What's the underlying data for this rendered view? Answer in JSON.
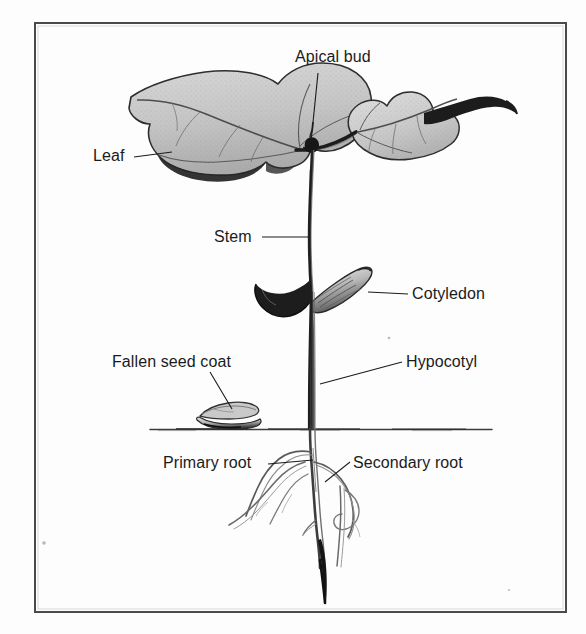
{
  "figure": {
    "background_color": "#fdfdfd",
    "ink_color": "#1b1b1b",
    "frame": {
      "x": 34,
      "y": 22,
      "width": 532,
      "height": 590,
      "border_color": "#4a4a4a",
      "border_width": 2
    },
    "soil_line": {
      "y": 429,
      "x_start": 150,
      "x_end": 492,
      "color": "#3a3a3a"
    }
  },
  "labels": [
    {
      "id": "apical-bud",
      "text": "Apical bud",
      "x": 295,
      "y": 48,
      "align": "left",
      "leader": {
        "x1": 318,
        "y1": 73,
        "x2": 311,
        "y2": 142
      }
    },
    {
      "id": "leaf",
      "text": "Leaf",
      "x": 93,
      "y": 147,
      "align": "left",
      "leader": {
        "x1": 134,
        "y1": 157,
        "x2": 172,
        "y2": 152
      }
    },
    {
      "id": "stem",
      "text": "Stem",
      "x": 214,
      "y": 228,
      "align": "left",
      "leader": {
        "x1": 262,
        "y1": 237,
        "x2": 310,
        "y2": 237
      }
    },
    {
      "id": "cotyledon",
      "text": "Cotyledon",
      "x": 412,
      "y": 285,
      "align": "left",
      "leader": {
        "x1": 408,
        "y1": 294,
        "x2": 368,
        "y2": 292
      }
    },
    {
      "id": "fallen-seed-coat",
      "text": "Fallen seed coat",
      "x": 112,
      "y": 353,
      "align": "left",
      "leader": {
        "x1": 210,
        "y1": 372,
        "x2": 232,
        "y2": 409
      }
    },
    {
      "id": "hypocotyl",
      "text": "Hypocotyl",
      "x": 406,
      "y": 353,
      "align": "left",
      "leader": {
        "x1": 402,
        "y1": 362,
        "x2": 320,
        "y2": 384
      }
    },
    {
      "id": "primary-root",
      "text": "Primary root",
      "x": 163,
      "y": 454,
      "align": "left",
      "leader": {
        "x1": 268,
        "y1": 464,
        "x2": 313,
        "y2": 460
      }
    },
    {
      "id": "secondary-root",
      "text": "Secondary root",
      "x": 353,
      "y": 454,
      "align": "left",
      "leader": {
        "x1": 350,
        "y1": 462,
        "x2": 325,
        "y2": 482
      }
    }
  ],
  "parts": {
    "leaf_left": "large lobed heart-shaped leaf, stippled gray, dark lower edge",
    "leaf_right": "smaller lobed leaf with dark petiole extending right",
    "stem": "vertical dark stem from apical bud down to soil line",
    "apical_bud": "small dark bud at junction of both petioles",
    "cotyledon_left": "dark curved cotyledon hooking down-left",
    "cotyledon_right": "lighter striped cotyledon pointing up-right",
    "seed_coat": "fallen seed coat resting on the soil surface",
    "primary_root": "central taproot descending with dark tip",
    "secondary_roots": "several lateral roots branching from the taproot"
  }
}
